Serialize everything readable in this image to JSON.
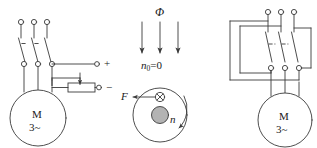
{
  "diagram": {
    "colors": {
      "line": "#3a3a3a",
      "rotor_fill": "#b3b3b3",
      "background": "#ffffff"
    }
  },
  "left_circuit": {
    "name": "rotor-resistance-starting-circuit",
    "motor": {
      "label_top": "M",
      "label_bottom": "3~"
    },
    "supply_terminals": [
      "L1",
      "L2",
      "L3"
    ],
    "dc_terminals": {
      "positive": "+",
      "negative": "−"
    },
    "rheostat_label": ""
  },
  "middle_diagram": {
    "name": "flux-force-rotor-illustration",
    "flux_label": "Φ",
    "flux_arrow_count": 3,
    "speed_label": {
      "symbol": "n",
      "subscript": "0",
      "equals": "=0",
      "full": "n₀=0"
    },
    "force_label": "F",
    "rotation_label": "n",
    "conductor_symbol": "⊗"
  },
  "right_circuit": {
    "name": "reversing-switch-circuit",
    "motor": {
      "label_top": "M",
      "label_bottom": "3~"
    },
    "supply_terminals": [
      "L1",
      "L2",
      "L3"
    ],
    "output_terminals": [
      "U",
      "V",
      "W"
    ]
  }
}
